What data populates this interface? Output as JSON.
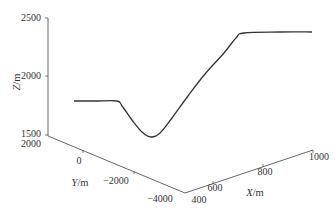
{
  "chart_data": {
    "type": "line",
    "projection": "3d",
    "title": "",
    "xlabel": "X/m",
    "ylabel": "Y/m",
    "zlabel": "Z/m",
    "x_ticks": [
      "400",
      "600",
      "800",
      "1000"
    ],
    "y_ticks": [
      "2000",
      "0",
      "−2000",
      "−4000"
    ],
    "z_ticks": [
      "1500",
      "2000",
      "2500"
    ],
    "xlim": [
      400,
      1000
    ],
    "ylim": [
      -4000,
      2000
    ],
    "zlim": [
      1500,
      2500
    ],
    "grid": false,
    "legend": null,
    "series": [
      {
        "name": "trajectory",
        "description": "flat at ~1800 m, dips to ~1500 m minimum, rises steadily to ~2380 m plateau",
        "z_profile": [
          1800,
          1800,
          1800,
          1750,
          1620,
          1520,
          1500,
          1560,
          1700,
          1880,
          2060,
          2240,
          2370,
          2380,
          2380,
          2380
        ],
        "screen_points": [
          [
            74,
            101
          ],
          [
            95,
            101
          ],
          [
            117,
            101
          ],
          [
            122,
            106
          ],
          [
            132,
            120
          ],
          [
            142,
            132
          ],
          [
            151,
            137
          ],
          [
            160,
            133
          ],
          [
            172,
            118
          ],
          [
            188,
            96
          ],
          [
            205,
            74
          ],
          [
            224,
            53
          ],
          [
            236,
            38
          ],
          [
            244,
            33
          ],
          [
            280,
            32
          ],
          [
            312,
            32
          ]
        ]
      }
    ]
  },
  "axes": {
    "z": {
      "label_main": "Z",
      "label_unit": "/m",
      "ticks": [
        "2500",
        "2000",
        "1500"
      ]
    },
    "y": {
      "label_main": "Y",
      "label_unit": "/m",
      "ticks": [
        "2000",
        "0",
        "−2000",
        "−4000"
      ]
    },
    "x": {
      "label_main": "X",
      "label_unit": "/m",
      "ticks": [
        "400",
        "600",
        "800",
        "1000"
      ]
    }
  },
  "colors": {
    "line": "#333333",
    "axis": "#555555",
    "text": "#333333",
    "background": "#ffffff"
  }
}
